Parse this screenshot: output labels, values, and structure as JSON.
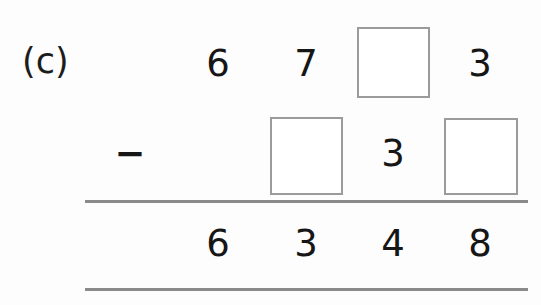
{
  "problem": {
    "part_label": "(c)",
    "operator": "−",
    "operator_name": "minus-sign",
    "columns": 4,
    "rows": [
      {
        "role": "minuend",
        "cells": [
          {
            "type": "digit",
            "value": "6"
          },
          {
            "type": "digit",
            "value": "7"
          },
          {
            "type": "box",
            "value": ""
          },
          {
            "type": "digit",
            "value": "3"
          }
        ]
      },
      {
        "role": "subtrahend",
        "cells": [
          {
            "type": "empty",
            "value": ""
          },
          {
            "type": "box",
            "value": ""
          },
          {
            "type": "digit",
            "value": "3"
          },
          {
            "type": "box",
            "value": ""
          }
        ]
      },
      {
        "role": "difference",
        "cells": [
          {
            "type": "digit",
            "value": "6"
          },
          {
            "type": "digit",
            "value": "3"
          },
          {
            "type": "digit",
            "value": "4"
          },
          {
            "type": "digit",
            "value": "8"
          }
        ]
      }
    ]
  },
  "colors": {
    "ink": "#161616",
    "box_border": "#9b9b9b",
    "rule": "#8a8a8a",
    "page_background": "#fdfdfd"
  }
}
